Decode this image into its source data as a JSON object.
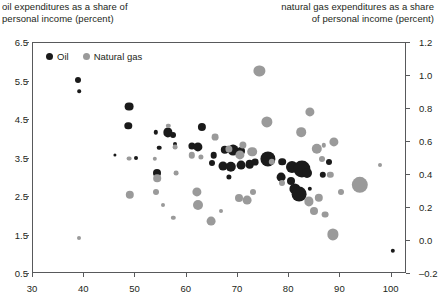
{
  "titles": {
    "left": "oil expenditures as a share of\npersonal income (percent)",
    "right": "natural gas expenditures as a share\nof personal income (percent)"
  },
  "legend": {
    "items": [
      {
        "label": "Oil",
        "color": "#1a1a1a",
        "series": "oil"
      },
      {
        "label": "Natural gas",
        "color": "#9a9a9a",
        "series": "natural_gas"
      }
    ]
  },
  "colors": {
    "oil": "#1a1a1a",
    "natural_gas": "#9a9a9a",
    "axis": "#58595b",
    "text": "#231f20",
    "background": "#ffffff"
  },
  "chart_data": {
    "type": "scatter",
    "title": "",
    "subtitle": "",
    "xlabel": "",
    "ylabel": "oil expenditures as a share of personal income (percent)",
    "y2label": "natural gas expenditures as a share of personal income (percent)",
    "grid": false,
    "legend_position": "top-left",
    "xlim": [
      30,
      103
    ],
    "ylim": [
      0.5,
      6.5
    ],
    "y2lim": [
      -0.2,
      1.2
    ],
    "xticks": [
      30,
      40,
      50,
      60,
      70,
      80,
      90,
      100
    ],
    "yticks": [
      0.5,
      1.5,
      2.5,
      3.5,
      4.5,
      5.5,
      6.5
    ],
    "y2ticks": [
      -0.2,
      0.0,
      0.2,
      0.4,
      0.6,
      0.8,
      1.0,
      1.2
    ],
    "xtick_labels": [
      "30",
      "40",
      "50",
      "60",
      "70",
      "80",
      "90",
      "100"
    ],
    "ytick_labels": [
      "0.5",
      "1.5",
      "2.5",
      "3.5",
      "4.5",
      "5.5",
      "6.5"
    ],
    "y2tick_labels": [
      "-0.2",
      "0.0",
      "0.2",
      "0.4",
      "0.6",
      "0.8",
      "1.0",
      "1.2"
    ],
    "series": [
      {
        "name": "Oil",
        "axis": "left",
        "color": "#1a1a1a",
        "points": [
          {
            "x": 38.8,
            "y": 5.55,
            "r": 3.0
          },
          {
            "x": 39.0,
            "y": 5.25,
            "r": 1.8
          },
          {
            "x": 48.8,
            "y": 4.85,
            "r": 4.4
          },
          {
            "x": 48.6,
            "y": 4.35,
            "r": 3.7
          },
          {
            "x": 54.0,
            "y": 4.18,
            "r": 2.2
          },
          {
            "x": 56.3,
            "y": 4.18,
            "r": 4.6
          },
          {
            "x": 57.4,
            "y": 4.12,
            "r": 3.0
          },
          {
            "x": 57.8,
            "y": 3.88,
            "r": 2.0
          },
          {
            "x": 54.6,
            "y": 3.78,
            "r": 2.3
          },
          {
            "x": 63.0,
            "y": 4.32,
            "r": 4.1
          },
          {
            "x": 61.0,
            "y": 3.82,
            "r": 3.6
          },
          {
            "x": 62.2,
            "y": 3.8,
            "r": 4.6
          },
          {
            "x": 54.2,
            "y": 3.12,
            "r": 4.0
          },
          {
            "x": 65.3,
            "y": 3.58,
            "r": 3.3
          },
          {
            "x": 65.0,
            "y": 3.38,
            "r": 3.0
          },
          {
            "x": 67.4,
            "y": 3.72,
            "r": 4.2
          },
          {
            "x": 69.0,
            "y": 3.72,
            "r": 5.4
          },
          {
            "x": 70.6,
            "y": 3.7,
            "r": 4.0
          },
          {
            "x": 67.0,
            "y": 3.3,
            "r": 4.5
          },
          {
            "x": 68.6,
            "y": 3.28,
            "r": 5.2
          },
          {
            "x": 70.6,
            "y": 3.32,
            "r": 4.4
          },
          {
            "x": 72.3,
            "y": 3.35,
            "r": 4.3
          },
          {
            "x": 73.4,
            "y": 3.4,
            "r": 3.4
          },
          {
            "x": 68.2,
            "y": 3.02,
            "r": 2.6
          },
          {
            "x": 75.8,
            "y": 3.48,
            "r": 7.6
          },
          {
            "x": 78.6,
            "y": 3.42,
            "r": 3.8
          },
          {
            "x": 80.6,
            "y": 3.28,
            "r": 6.0
          },
          {
            "x": 82.5,
            "y": 3.22,
            "r": 8.6
          },
          {
            "x": 83.4,
            "y": 3.12,
            "r": 5.0
          },
          {
            "x": 78.5,
            "y": 3.02,
            "r": 4.4
          },
          {
            "x": 80.4,
            "y": 2.92,
            "r": 4.0
          },
          {
            "x": 81.2,
            "y": 2.72,
            "r": 5.6
          },
          {
            "x": 82.0,
            "y": 2.58,
            "r": 7.4
          },
          {
            "x": 84.0,
            "y": 2.72,
            "r": 2.2
          },
          {
            "x": 86.6,
            "y": 3.08,
            "r": 3.2
          },
          {
            "x": 87.8,
            "y": 3.4,
            "r": 3.0
          },
          {
            "x": 100.2,
            "y": 1.1,
            "r": 2.2
          },
          {
            "x": 46.0,
            "y": 3.6,
            "r": 1.6
          },
          {
            "x": 50.2,
            "y": 3.52,
            "r": 2.0
          }
        ]
      },
      {
        "name": "Natural gas",
        "axis": "right",
        "color": "#9a9a9a",
        "points": [
          {
            "x": 38.9,
            "y": 0.02,
            "r": 2.0
          },
          {
            "x": 48.8,
            "y": 0.5,
            "r": 2.4
          },
          {
            "x": 48.9,
            "y": 0.28,
            "r": 4.2
          },
          {
            "x": 53.8,
            "y": 0.5,
            "r": 2.2
          },
          {
            "x": 54.2,
            "y": 0.38,
            "r": 3.8
          },
          {
            "x": 54.0,
            "y": 0.3,
            "r": 3.0
          },
          {
            "x": 55.4,
            "y": 0.22,
            "r": 2.0
          },
          {
            "x": 57.4,
            "y": 0.14,
            "r": 2.2
          },
          {
            "x": 57.8,
            "y": 0.57,
            "r": 2.4
          },
          {
            "x": 61.0,
            "y": 0.52,
            "r": 3.2
          },
          {
            "x": 62.8,
            "y": 0.51,
            "r": 2.6
          },
          {
            "x": 62.0,
            "y": 0.3,
            "r": 4.6
          },
          {
            "x": 62.3,
            "y": 0.22,
            "r": 5.0
          },
          {
            "x": 65.6,
            "y": 0.63,
            "r": 3.4
          },
          {
            "x": 68.2,
            "y": 0.56,
            "r": 3.6
          },
          {
            "x": 70.4,
            "y": 0.52,
            "r": 4.6
          },
          {
            "x": 71.0,
            "y": 0.58,
            "r": 3.6
          },
          {
            "x": 72.8,
            "y": 0.54,
            "r": 4.8
          },
          {
            "x": 74.2,
            "y": 1.03,
            "r": 5.6
          },
          {
            "x": 75.6,
            "y": 0.72,
            "r": 5.6
          },
          {
            "x": 73.0,
            "y": 0.3,
            "r": 3.0
          },
          {
            "x": 70.2,
            "y": 0.26,
            "r": 4.0
          },
          {
            "x": 71.8,
            "y": 0.25,
            "r": 4.4
          },
          {
            "x": 76.6,
            "y": 0.48,
            "r": 3.2
          },
          {
            "x": 78.6,
            "y": 0.35,
            "r": 3.0
          },
          {
            "x": 82.4,
            "y": 0.66,
            "r": 4.8
          },
          {
            "x": 84.0,
            "y": 0.78,
            "r": 4.6
          },
          {
            "x": 85.4,
            "y": 0.56,
            "r": 5.2
          },
          {
            "x": 86.4,
            "y": 0.5,
            "r": 3.0
          },
          {
            "x": 86.8,
            "y": 0.58,
            "r": 2.2
          },
          {
            "x": 88.8,
            "y": 0.6,
            "r": 4.6
          },
          {
            "x": 88.0,
            "y": 0.4,
            "r": 3.2
          },
          {
            "x": 85.8,
            "y": 0.26,
            "r": 4.2
          },
          {
            "x": 83.8,
            "y": 0.24,
            "r": 4.6
          },
          {
            "x": 84.8,
            "y": 0.18,
            "r": 4.0
          },
          {
            "x": 87.0,
            "y": 0.16,
            "r": 3.4
          },
          {
            "x": 90.2,
            "y": 0.3,
            "r": 3.0
          },
          {
            "x": 93.8,
            "y": 0.34,
            "r": 8.2
          },
          {
            "x": 88.6,
            "y": 0.04,
            "r": 5.6
          },
          {
            "x": 97.8,
            "y": 0.46,
            "r": 2.0
          },
          {
            "x": 66.6,
            "y": 0.18,
            "r": 2.0
          },
          {
            "x": 64.8,
            "y": 0.12,
            "r": 4.4
          },
          {
            "x": 58.0,
            "y": 0.41,
            "r": 2.4
          },
          {
            "x": 56.4,
            "y": 0.7,
            "r": 2.2
          }
        ]
      }
    ]
  }
}
